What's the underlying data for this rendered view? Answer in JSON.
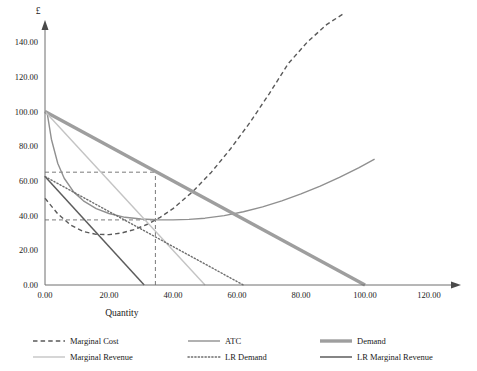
{
  "chart_data": {
    "type": "line",
    "title": "",
    "xlabel": "Quantity",
    "ylabel": "£",
    "xlim": [
      0,
      120
    ],
    "ylim": [
      0,
      150
    ],
    "xticks": [
      "0.00",
      "20.00",
      "40.00",
      "60.00",
      "80.00",
      "100.00",
      "120.00"
    ],
    "yticks": [
      "0.00",
      "20.00",
      "40.00",
      "60.00",
      "80.00",
      "100.00",
      "120.00",
      "140.00"
    ],
    "xtick_values": [
      0,
      20,
      40,
      60,
      80,
      100,
      120
    ],
    "ytick_values": [
      0,
      20,
      40,
      60,
      80,
      100,
      120,
      140
    ],
    "grid": false,
    "legend_position": "bottom",
    "guides": {
      "vertical_q": 34.5,
      "horizontal_price": 65.0,
      "horizontal_atc": 37.5
    },
    "series": [
      {
        "name": "Marginal Cost",
        "style": "dashed",
        "color": "#5a5a5a",
        "width": 1.4,
        "points": [
          [
            0,
            50
          ],
          [
            4,
            41
          ],
          [
            8,
            34.5
          ],
          [
            12,
            30.8
          ],
          [
            16,
            29.2
          ],
          [
            20,
            29.0
          ],
          [
            24,
            30.0
          ],
          [
            28,
            32.0
          ],
          [
            32,
            35.0
          ],
          [
            36,
            39.0
          ],
          [
            40,
            44.0
          ],
          [
            46,
            53.5
          ],
          [
            52,
            65.0
          ],
          [
            58,
            78.5
          ],
          [
            64,
            93.5
          ],
          [
            70,
            110.0
          ],
          [
            76,
            127.5
          ],
          [
            82,
            140.0
          ],
          [
            88,
            150.0
          ],
          [
            93,
            156.0
          ]
        ]
      },
      {
        "name": "ATC",
        "style": "solid",
        "color": "#909090",
        "width": 1.4,
        "points": [
          [
            0.6,
            100
          ],
          [
            2,
            84
          ],
          [
            4,
            70
          ],
          [
            6,
            61.5
          ],
          [
            9,
            53.5
          ],
          [
            12,
            48.5
          ],
          [
            16,
            44.0
          ],
          [
            20,
            41.2
          ],
          [
            25,
            39.0
          ],
          [
            30,
            38.0
          ],
          [
            35,
            37.6
          ],
          [
            40,
            37.5
          ],
          [
            45,
            37.8
          ],
          [
            50,
            38.5
          ],
          [
            56,
            40.0
          ],
          [
            62,
            42.2
          ],
          [
            68,
            45.0
          ],
          [
            74,
            48.5
          ],
          [
            80,
            52.5
          ],
          [
            86,
            57.0
          ],
          [
            92,
            62.0
          ],
          [
            98,
            67.5
          ],
          [
            103,
            72.5
          ]
        ]
      },
      {
        "name": "Demand",
        "style": "solid",
        "color": "#9e9e9e",
        "width": 3.4,
        "points": [
          [
            0,
            100
          ],
          [
            100,
            0
          ]
        ]
      },
      {
        "name": "Marginal Revenue",
        "style": "solid",
        "color": "#c4c4c4",
        "width": 1.4,
        "points": [
          [
            0,
            100
          ],
          [
            50,
            0
          ]
        ]
      },
      {
        "name": "LR Demand",
        "style": "dotted",
        "color": "#6e6e6e",
        "width": 1.4,
        "points": [
          [
            0,
            62.5
          ],
          [
            62,
            0
          ]
        ]
      },
      {
        "name": "LR Marginal Revenue",
        "style": "solid",
        "color": "#5c5c5c",
        "width": 1.5,
        "points": [
          [
            0,
            62.5
          ],
          [
            31,
            0
          ]
        ]
      }
    ]
  },
  "legend": {
    "items": [
      {
        "label": "Marginal Cost",
        "style": "dashed",
        "color": "#5a5a5a",
        "width": 1.4
      },
      {
        "label": "ATC",
        "style": "solid",
        "color": "#909090",
        "width": 1.4
      },
      {
        "label": "Demand",
        "style": "solid",
        "color": "#9e9e9e",
        "width": 3.4
      },
      {
        "label": "Marginal Revenue",
        "style": "solid",
        "color": "#c4c4c4",
        "width": 1.4
      },
      {
        "label": "LR Demand",
        "style": "dotted",
        "color": "#6e6e6e",
        "width": 1.4
      },
      {
        "label": "LR Marginal Revenue",
        "style": "solid",
        "color": "#5c5c5c",
        "width": 1.5
      }
    ]
  },
  "colors": {
    "axis": "#6e6e6e",
    "guide": "#7a7a7a",
    "text": "#1a1a1a",
    "background": "#ffffff"
  }
}
